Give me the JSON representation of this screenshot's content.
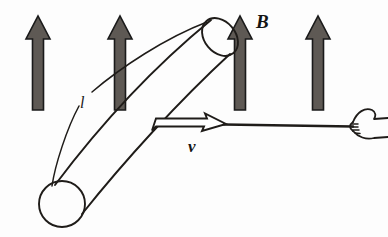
{
  "figure": {
    "kind": "physics-diagram",
    "background_color": "#fdfdfd",
    "width": 388,
    "height": 237
  },
  "colors": {
    "field_arrow_fill": "#5e5954",
    "field_arrow_stroke": "#1a1a1a",
    "line_stroke": "#1f1c19",
    "label_color": "#151515",
    "rod_fill": "#ffffff"
  },
  "labels": {
    "magnetic_field": "B",
    "velocity": "v",
    "length": "l"
  },
  "field_arrows": {
    "name": "magnetic-field-arrows",
    "count": 4,
    "direction": "up",
    "x_positions": [
      38,
      120,
      240,
      318
    ],
    "top_y": 12,
    "bottom_y": 110
  },
  "cylinder": {
    "name": "conducting-rod-cylinder",
    "top_cap": {
      "cx": 219,
      "cy": 39,
      "rx": 16,
      "ry": 21,
      "rotation": -38
    },
    "bottom_cap": {
      "cx": 62,
      "cy": 204,
      "r": 23
    }
  },
  "velocity_arrow": {
    "name": "velocity-block-arrow",
    "style": "hollow-outline",
    "tail_x": 152,
    "head_x": 225,
    "y": 124
  },
  "rod_line": {
    "name": "pull-rod",
    "from_x": 225,
    "to_x": 352,
    "y": 125
  },
  "hand": {
    "name": "gripping-hand",
    "x": 352,
    "y": 125,
    "description": "hand gripping the rod from the right"
  },
  "leader_lines": {
    "length_label_leader": "curved double line from l label along the cylinder axis"
  }
}
